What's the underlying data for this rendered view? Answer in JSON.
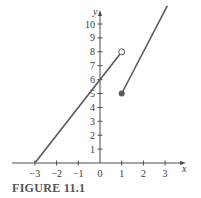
{
  "caption": "FIGURE 11.1",
  "colors": {
    "axis": "#4a4a4a",
    "line": "#5a5a5a",
    "text": "#3a3a3a",
    "caption": "#555555"
  },
  "chart_data": {
    "type": "line",
    "title": "",
    "caption": "FIGURE 11.1",
    "xlabel": "x",
    "ylabel": "y",
    "xlim": [
      -3.8,
      3.9
    ],
    "ylim": [
      0,
      11
    ],
    "x_ticks": [
      -3,
      -2,
      -1,
      0,
      1,
      2,
      3
    ],
    "x_tick_labels": [
      "−3",
      "−2",
      "−1",
      "0",
      "1",
      "2",
      "3"
    ],
    "y_ticks": [
      1,
      2,
      3,
      4,
      5,
      6,
      7,
      8,
      9,
      10
    ],
    "y_tick_labels": [
      "1",
      "2",
      "3",
      "4",
      "5",
      "6",
      "7",
      "8",
      "9",
      "10"
    ],
    "grid": false,
    "legend": null,
    "series": [
      {
        "name": "constant piece (y = 0, x < -3)",
        "x": [
          -3.8,
          -3
        ],
        "y": [
          0,
          0
        ]
      },
      {
        "name": "left piece (y = 2x + 6, -3 ≤ x < 1)",
        "x": [
          -3,
          1
        ],
        "y": [
          0,
          8
        ],
        "end_marker": "open-circle"
      },
      {
        "name": "right piece (y = 3x + 2, x ≥ 1)",
        "x": [
          1,
          3.1
        ],
        "y": [
          5,
          11.3
        ],
        "start_marker": "filled-dot"
      }
    ],
    "annotations": [
      {
        "type": "open-circle",
        "x": 1,
        "y": 8
      },
      {
        "type": "filled-dot",
        "x": 1,
        "y": 5
      }
    ]
  }
}
